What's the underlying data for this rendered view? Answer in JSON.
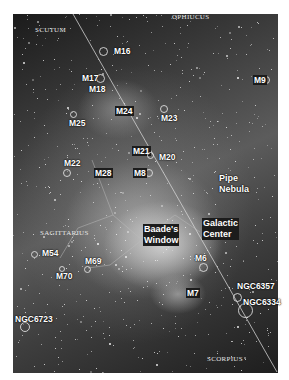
{
  "image": {
    "subject": "Sagittarius region of the Milky Way with labeled deep-sky objects",
    "constellations": [
      {
        "name": "SCUTUM",
        "x": 35,
        "y": 26
      },
      {
        "name": "OPHIUCUS",
        "x": 172,
        "y": 13
      },
      {
        "name": "SAGITTARIUS",
        "x": 40,
        "y": 229
      },
      {
        "name": "SCORPIUS",
        "x": 207,
        "y": 355
      }
    ],
    "objects": [
      {
        "id": "M16",
        "label": "M16",
        "x": 114,
        "y": 46,
        "boxed": false,
        "ring": {
          "x": 103,
          "y": 46,
          "d": 9
        }
      },
      {
        "id": "M17",
        "label": "M17",
        "x": 82,
        "y": 73,
        "boxed": false,
        "ring": {
          "x": 100,
          "y": 73,
          "d": 9
        }
      },
      {
        "id": "M18",
        "label": "M18",
        "x": 89,
        "y": 84,
        "boxed": false,
        "ring": null
      },
      {
        "id": "M24",
        "label": "M24",
        "x": 115,
        "y": 106,
        "boxed": true,
        "ring": null
      },
      {
        "id": "M25",
        "label": "M25",
        "x": 69,
        "y": 118,
        "boxed": false,
        "ring": {
          "x": 73,
          "y": 109,
          "d": 7
        }
      },
      {
        "id": "M23",
        "label": "M23",
        "x": 161,
        "y": 113,
        "boxed": false,
        "ring": {
          "x": 164,
          "y": 104,
          "d": 8
        }
      },
      {
        "id": "M9",
        "label": "M9",
        "x": 253,
        "y": 75,
        "boxed": true,
        "ring": {
          "x": 266,
          "y": 75,
          "d": 8
        }
      },
      {
        "id": "M21",
        "label": "M21",
        "x": 132,
        "y": 146,
        "boxed": true,
        "ring": null
      },
      {
        "id": "M20",
        "label": "M20",
        "x": 159,
        "y": 152,
        "boxed": false,
        "ring": {
          "x": 150,
          "y": 150,
          "d": 7
        }
      },
      {
        "id": "M8",
        "label": "M8",
        "x": 133,
        "y": 168,
        "boxed": true,
        "ring": {
          "x": 149,
          "y": 168,
          "d": 8
        }
      },
      {
        "id": "M22",
        "label": "M22",
        "x": 64,
        "y": 158,
        "boxed": false,
        "ring": {
          "x": 67,
          "y": 168,
          "d": 8
        }
      },
      {
        "id": "M28",
        "label": "M28",
        "x": 94,
        "y": 168,
        "boxed": true,
        "ring": null
      },
      {
        "id": "PipeNebula",
        "label": "Pipe",
        "label2": "Nebula",
        "x": 219,
        "y": 173,
        "boxed": false,
        "ring": null
      },
      {
        "id": "GalacticCenter",
        "label": "Galactic",
        "label2": "Center",
        "x": 202,
        "y": 218,
        "boxed": true,
        "ring": null
      },
      {
        "id": "BaadesWindow",
        "label": "Baade's",
        "label2": "Window",
        "x": 143,
        "y": 224,
        "boxed": true,
        "ring": null
      },
      {
        "id": "M54",
        "label": "M54",
        "x": 42,
        "y": 248,
        "boxed": false,
        "ring": {
          "x": 34,
          "y": 249,
          "d": 7
        }
      },
      {
        "id": "M69",
        "label": "M69",
        "x": 85,
        "y": 256,
        "boxed": false,
        "ring": {
          "x": 87,
          "y": 264,
          "d": 7
        }
      },
      {
        "id": "M70",
        "label": "M70",
        "x": 56,
        "y": 271,
        "boxed": false,
        "ring": {
          "x": 62,
          "y": 264,
          "d": 6
        }
      },
      {
        "id": "M6",
        "label": "M6",
        "x": 195,
        "y": 253,
        "boxed": false,
        "ring": {
          "x": 203,
          "y": 262,
          "d": 9
        }
      },
      {
        "id": "M7",
        "label": "M7",
        "x": 186,
        "y": 288,
        "boxed": true,
        "ring": null
      },
      {
        "id": "NGC6357",
        "label": "NGC6357",
        "x": 237,
        "y": 281,
        "boxed": false,
        "ring": {
          "x": 237,
          "y": 292,
          "d": 9
        }
      },
      {
        "id": "NGC6334",
        "label": "NGC6334",
        "x": 243,
        "y": 297,
        "boxed": false,
        "ring": {
          "x": 245,
          "y": 305,
          "d": 15
        }
      },
      {
        "id": "NGC6723",
        "label": "NGC6723",
        "x": 15,
        "y": 314,
        "boxed": false,
        "ring": {
          "x": 25,
          "y": 322,
          "d": 10
        }
      }
    ]
  }
}
